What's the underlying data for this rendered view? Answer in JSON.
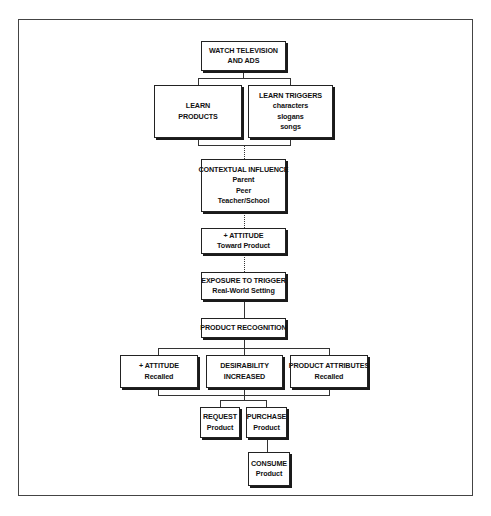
{
  "diagram": {
    "type": "flowchart",
    "nodes": {
      "watch_tv": {
        "lines": [
          "WATCH TELEVISION",
          "AND ADS"
        ]
      },
      "learn_products": {
        "lines": [
          "LEARN",
          "PRODUCTS"
        ]
      },
      "learn_triggers": {
        "lines": [
          "LEARN TRIGGERS",
          "characters",
          "slogans",
          "songs"
        ]
      },
      "contextual_influence": {
        "lines": [
          "CONTEXTUAL INFLUENCE",
          "Parent",
          "Peer",
          "Teacher/School"
        ]
      },
      "attitude_toward": {
        "lines": [
          "+ ATTITUDE",
          "Toward Product"
        ]
      },
      "exposure_trigger": {
        "lines": [
          "EXPOSURE TO TRIGGER",
          "Real-World Setting"
        ]
      },
      "product_recognition": {
        "lines": [
          "PRODUCT RECOGNITION"
        ]
      },
      "attitude_recalled": {
        "lines": [
          "+ ATTITUDE",
          "Recalled"
        ]
      },
      "desirability": {
        "lines": [
          "DESIRABILITY",
          "INCREASED"
        ]
      },
      "product_attributes": {
        "lines": [
          "PRODUCT ATTRIBUTES",
          "Recalled"
        ]
      },
      "request": {
        "lines": [
          "REQUEST",
          "Product"
        ]
      },
      "purchase": {
        "lines": [
          "PURCHASE",
          "Product"
        ]
      },
      "consume": {
        "lines": [
          "CONSUME",
          "Product"
        ]
      }
    },
    "edges": [
      [
        "watch_tv",
        "learn_products"
      ],
      [
        "watch_tv",
        "learn_triggers"
      ],
      [
        "learn_products",
        "contextual_influence"
      ],
      [
        "learn_triggers",
        "contextual_influence"
      ],
      [
        "contextual_influence",
        "attitude_toward"
      ],
      [
        "attitude_toward",
        "exposure_trigger"
      ],
      [
        "exposure_trigger",
        "product_recognition"
      ],
      [
        "product_recognition",
        "attitude_recalled"
      ],
      [
        "product_recognition",
        "desirability"
      ],
      [
        "product_recognition",
        "product_attributes"
      ],
      [
        "desirability",
        "request"
      ],
      [
        "desirability",
        "purchase"
      ],
      [
        "purchase",
        "consume"
      ]
    ]
  }
}
